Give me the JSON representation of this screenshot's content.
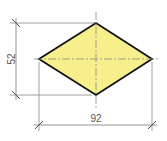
{
  "diagram": {
    "shape": "rhombus",
    "fill_color": "#F7EE8C",
    "outline_color": "#111111",
    "dimension_line_color": "#777777",
    "centerline_color": "#888888",
    "vertices": {
      "top": [
        96,
        23
      ],
      "right": [
        152,
        59
      ],
      "bottom": [
        96,
        95
      ],
      "left": [
        39,
        59
      ]
    },
    "dimensions": {
      "height": {
        "label": "52",
        "orientation": "vertical"
      },
      "width": {
        "label": "92",
        "orientation": "horizontal"
      }
    }
  }
}
